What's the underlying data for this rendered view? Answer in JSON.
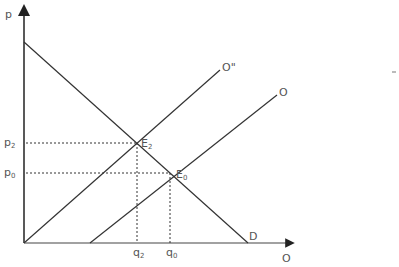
{
  "diagram": {
    "type": "supply-demand",
    "axes": {
      "y_label": "p",
      "x_label": "O"
    },
    "curves": {
      "demand": {
        "label": "D"
      },
      "supply_original": {
        "label": "O"
      },
      "supply_shifted": {
        "label": "O\""
      }
    },
    "equilibria": [
      {
        "label": "E",
        "sub": "2"
      },
      {
        "label": "E",
        "sub": "0"
      }
    ],
    "price_ticks": [
      {
        "label": "p",
        "sub": "2"
      },
      {
        "label": "p",
        "sub": "0"
      }
    ],
    "quantity_ticks": [
      {
        "label": "q",
        "sub": "2"
      },
      {
        "label": "q",
        "sub": "0"
      }
    ],
    "colors": {
      "line": "#222222",
      "text": "#555555"
    }
  }
}
